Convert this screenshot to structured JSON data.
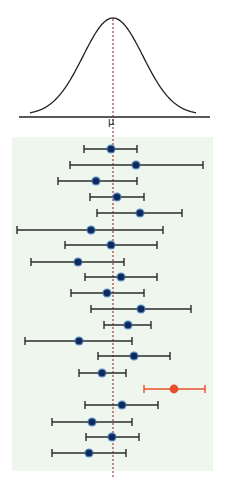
{
  "chart_data": {
    "type": "scatter",
    "subtype": "confidence-interval-plot-with-normal-curve",
    "title": "",
    "xlabel": "",
    "ylabel": "",
    "mean_label": "μ",
    "grid": false,
    "legend": null,
    "colors": {
      "curve": "#222222",
      "axis": "#222222",
      "mean_line": "#8b1a1a",
      "panel_bg": "#eef6ee",
      "interval": "#2b2b2b",
      "point": "#0d2a5c",
      "point_halo": "#3a6fb5",
      "outlier": "#e8502a"
    },
    "x_scale": {
      "mu_px": 113,
      "units_note": "pixel positions relative to image; mu at x=113"
    },
    "intervals": [
      {
        "lower": 84,
        "estimate": 111,
        "upper": 137,
        "y": 149,
        "contains_mu": true
      },
      {
        "lower": 70,
        "estimate": 136,
        "upper": 203,
        "y": 165,
        "contains_mu": true
      },
      {
        "lower": 58,
        "estimate": 96,
        "upper": 137,
        "y": 181,
        "contains_mu": true
      },
      {
        "lower": 90,
        "estimate": 117,
        "upper": 144,
        "y": 197,
        "contains_mu": true
      },
      {
        "lower": 97,
        "estimate": 140,
        "upper": 182,
        "y": 213,
        "contains_mu": true
      },
      {
        "lower": 17,
        "estimate": 91,
        "upper": 163,
        "y": 230,
        "contains_mu": true
      },
      {
        "lower": 65,
        "estimate": 111,
        "upper": 157,
        "y": 245,
        "contains_mu": true
      },
      {
        "lower": 31,
        "estimate": 78,
        "upper": 124,
        "y": 262,
        "contains_mu": true
      },
      {
        "lower": 85,
        "estimate": 121,
        "upper": 157,
        "y": 277,
        "contains_mu": true
      },
      {
        "lower": 71,
        "estimate": 107,
        "upper": 144,
        "y": 293,
        "contains_mu": true
      },
      {
        "lower": 91,
        "estimate": 141,
        "upper": 191,
        "y": 309,
        "contains_mu": true
      },
      {
        "lower": 104,
        "estimate": 128,
        "upper": 151,
        "y": 325,
        "contains_mu": true
      },
      {
        "lower": 25,
        "estimate": 79,
        "upper": 132,
        "y": 341,
        "contains_mu": true
      },
      {
        "lower": 98,
        "estimate": 134,
        "upper": 170,
        "y": 356,
        "contains_mu": true
      },
      {
        "lower": 79,
        "estimate": 102,
        "upper": 126,
        "y": 373,
        "contains_mu": true
      },
      {
        "lower": 144,
        "estimate": 174,
        "upper": 205,
        "y": 389,
        "contains_mu": false
      },
      {
        "lower": 85,
        "estimate": 122,
        "upper": 158,
        "y": 405,
        "contains_mu": true
      },
      {
        "lower": 52,
        "estimate": 92,
        "upper": 132,
        "y": 422,
        "contains_mu": true
      },
      {
        "lower": 86,
        "estimate": 112,
        "upper": 139,
        "y": 437,
        "contains_mu": true
      },
      {
        "lower": 52,
        "estimate": 89,
        "upper": 126,
        "y": 453,
        "contains_mu": true
      }
    ],
    "summary": {
      "total_intervals": 20,
      "containing_mu": 19,
      "missing_mu": 1
    }
  }
}
